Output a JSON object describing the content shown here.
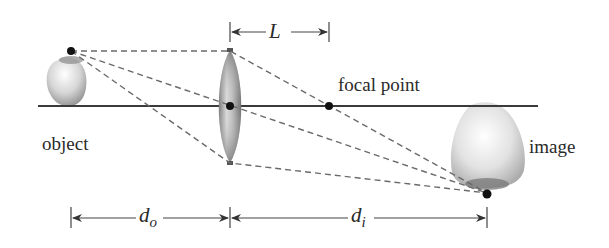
{
  "diagram": {
    "type": "thin lens ray diagram",
    "labels": {
      "object": "object",
      "image": "image",
      "focal_point": "focal point",
      "focal_length": "L",
      "object_distance_base": "d",
      "object_distance_sub": "o",
      "image_distance_base": "d",
      "image_distance_sub": "i"
    },
    "geometry": {
      "axis_y": 106,
      "axis_x_start": 38,
      "axis_x_end": 538,
      "object_point": [
        71,
        51
      ],
      "lens_center": [
        230,
        106
      ],
      "lens_top": [
        230,
        50
      ],
      "lens_bottom": [
        230,
        163
      ],
      "focal_point": [
        329,
        106
      ],
      "image_point": [
        487,
        193
      ]
    },
    "colors": {
      "axis": "#3a3a3a",
      "rays": "#6a6a6a",
      "points": "#111111",
      "dimension_lines": "#444444",
      "text": "#2a2a2a"
    }
  }
}
